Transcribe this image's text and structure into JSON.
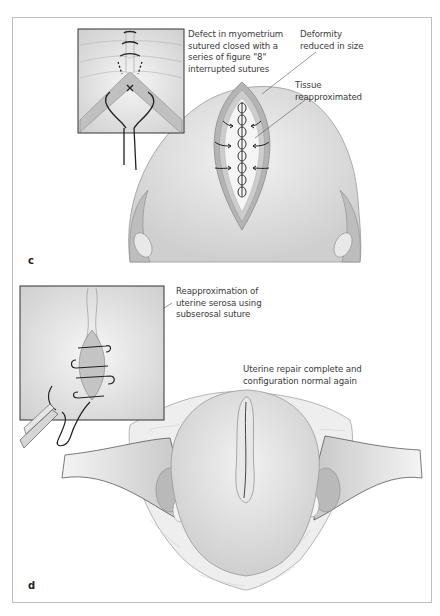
{
  "figure": {
    "panels": [
      {
        "letter": "c",
        "labels": {
          "defect": "Defect in myometrium\nsutured closed with a\nseries of figure \"8\"\ninterrupted sutures",
          "deformity": "Deformity\nreduced in size",
          "tissue": "Tissue\nreapproximated"
        }
      },
      {
        "letter": "d",
        "labels": {
          "serosa": "Reapproximation of\nuterine serosa using\nsubserosal suture",
          "repair": "Uterine repair complete and\nconfiguration normal again"
        }
      }
    ]
  },
  "colors": {
    "border": "#bdbdbd",
    "tissue_fill": "#dcdcdc",
    "tissue_dark": "#a8a8a8",
    "line": "#333333",
    "text": "#3a3a3a"
  }
}
